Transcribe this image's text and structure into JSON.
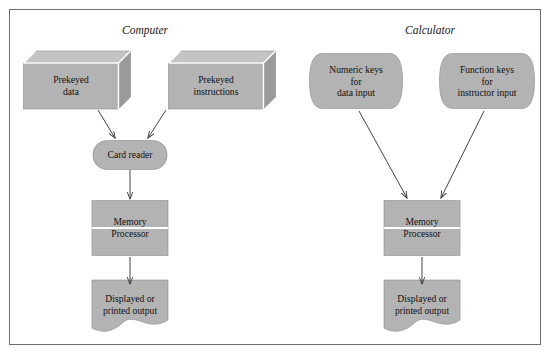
{
  "figure": {
    "panels": [
      {
        "id": "computer",
        "title": "Computer",
        "title_x": 145,
        "title_y": 24,
        "nodes": [
          {
            "id": "prekeyed-data",
            "shape": "cube",
            "label": "Prekeyed\ndata",
            "x": 71,
            "y": 86,
            "w": 95,
            "h": 46
          },
          {
            "id": "prekeyed-instructions",
            "shape": "cube",
            "label": "Prekeyed\ninstructions",
            "x": 216,
            "y": 86,
            "w": 95,
            "h": 46
          },
          {
            "id": "card-reader",
            "shape": "stadium",
            "label": "Card reader",
            "x": 130,
            "y": 155,
            "w": 74,
            "h": 29
          },
          {
            "id": "memory-processor",
            "shape": "split",
            "label": "Memory\nProcessor",
            "x": 130,
            "y": 228,
            "w": 76,
            "h": 55
          },
          {
            "id": "output",
            "shape": "document",
            "label": "Displayed or\nprinted output",
            "x": 130,
            "y": 305,
            "w": 76,
            "h": 50
          }
        ],
        "arrows": [
          {
            "id": "data-to-reader",
            "x1": 98,
            "y1": 110,
            "x2": 115,
            "y2": 138
          },
          {
            "id": "instructions-to-reader",
            "x1": 166,
            "y1": 110,
            "x2": 148,
            "y2": 138
          },
          {
            "id": "reader-to-memory",
            "x1": 130,
            "y1": 170,
            "x2": 130,
            "y2": 199
          },
          {
            "id": "memory-to-output",
            "x1": 130,
            "y1": 257,
            "x2": 130,
            "y2": 284
          }
        ]
      },
      {
        "id": "calculator",
        "title": "Calculator",
        "title_x": 430,
        "title_y": 24,
        "nodes": [
          {
            "id": "numeric-keys",
            "shape": "keypad",
            "label": "Numeric keys\nfor\ndata input",
            "x": 356,
            "y": 81,
            "w": 93,
            "h": 55
          },
          {
            "id": "function-keys",
            "shape": "keypad",
            "label": "Function keys\nfor\ninstructor input",
            "x": 487,
            "y": 81,
            "w": 95,
            "h": 55
          },
          {
            "id": "memory-processor",
            "shape": "split",
            "label": "Memory\nProcessor",
            "x": 422,
            "y": 228,
            "w": 76,
            "h": 55
          },
          {
            "id": "output",
            "shape": "document",
            "label": "Displayed or\nprinted output",
            "x": 422,
            "y": 305,
            "w": 76,
            "h": 50
          }
        ],
        "arrows": [
          {
            "id": "numeric-to-memory",
            "x1": 359,
            "y1": 111,
            "x2": 407,
            "y2": 198
          },
          {
            "id": "function-to-memory",
            "x1": 484,
            "y1": 111,
            "x2": 441,
            "y2": 198
          },
          {
            "id": "memory-to-output",
            "x1": 422,
            "y1": 257,
            "x2": 422,
            "y2": 284
          }
        ]
      }
    ],
    "colors": {
      "shape_fill": "#b3b3b3",
      "shape_top_face": "#c4c4c4",
      "shape_side_face": "#9a9a9a",
      "edge_highlight": "#ffffff",
      "outline": "#8a8a8a",
      "arrow": "#3a3a3a",
      "border": "#6e6e6e",
      "text": "#111111",
      "background": "#ffffff"
    }
  }
}
